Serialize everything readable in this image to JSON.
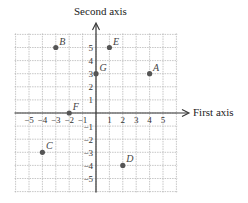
{
  "chart_data": {
    "type": "scatter",
    "title": "",
    "xlabel": "First axis",
    "ylabel": "Second axis",
    "xlim": [
      -6,
      6
    ],
    "ylim": [
      -6,
      6
    ],
    "grid": true,
    "x_ticks": [
      -5,
      -4,
      -3,
      -2,
      -1,
      1,
      2,
      3,
      4,
      5
    ],
    "y_ticks": [
      5,
      4,
      3,
      2,
      1,
      -1,
      -2,
      -3,
      -4,
      -5
    ],
    "points": [
      {
        "label": "A",
        "x": 4,
        "y": 3
      },
      {
        "label": "B",
        "x": -3,
        "y": 5
      },
      {
        "label": "C",
        "x": -4,
        "y": -3
      },
      {
        "label": "D",
        "x": 2,
        "y": -4
      },
      {
        "label": "E",
        "x": 1,
        "y": 5
      },
      {
        "label": "F",
        "x": -2,
        "y": 0
      },
      {
        "label": "G",
        "x": 0,
        "y": 3
      }
    ]
  },
  "colors": {
    "grid": "#b8b8b8",
    "axis": "#333333",
    "point": "#555555"
  }
}
